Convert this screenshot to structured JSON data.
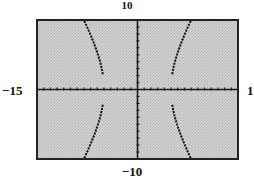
{
  "chart_data": {
    "type": "line",
    "title": "",
    "equation_estimate": "x^2/25 - y^2/64 = 1",
    "xlabel": "",
    "ylabel": "",
    "xlim": [
      -15,
      15
    ],
    "ylim": [
      -10,
      10
    ],
    "xscale_ticks": 1,
    "yscale_ticks": 1,
    "grid": false,
    "legend": null,
    "window_labels": {
      "ymax": "10",
      "ymin": "−10",
      "xmin": "−15",
      "xmax": "1"
    },
    "series": [
      {
        "name": "upper-left branch",
        "x": [
          -5.0,
          -5.5,
          -6.0,
          -6.5,
          -7.0,
          -7.5,
          -8.0,
          -8.3
        ],
        "y": [
          0.0,
          3.3,
          5.3,
          6.9,
          7.8,
          8.9,
          10.0,
          10.4
        ]
      },
      {
        "name": "upper-right branch",
        "x": [
          5.0,
          5.5,
          6.0,
          6.5,
          7.0,
          7.5,
          8.0,
          8.3
        ],
        "y": [
          0.0,
          3.3,
          5.3,
          6.9,
          7.8,
          8.9,
          10.0,
          10.4
        ]
      },
      {
        "name": "lower-left branch",
        "x": [
          -5.0,
          -5.5,
          -6.0,
          -6.5,
          -7.0,
          -7.5,
          -8.0,
          -8.3
        ],
        "y": [
          0.0,
          -3.3,
          -5.3,
          -6.9,
          -7.8,
          -8.9,
          -10.0,
          -10.4
        ]
      },
      {
        "name": "lower-right branch",
        "x": [
          5.0,
          5.5,
          6.0,
          6.5,
          7.0,
          7.5,
          8.0,
          8.3
        ],
        "y": [
          0.0,
          -3.3,
          -5.3,
          -6.9,
          -7.8,
          -8.9,
          -10.0,
          -10.4
        ]
      }
    ],
    "hyperbola": {
      "a": 5,
      "b": 8,
      "orientation": "horizontal",
      "gap_near_x_axis": 2.2
    },
    "colors": {
      "screen_bg": "#c9c9c9",
      "frame": "#222222",
      "curve": "#1a1a1a",
      "axes": "#1a1a1a"
    }
  }
}
